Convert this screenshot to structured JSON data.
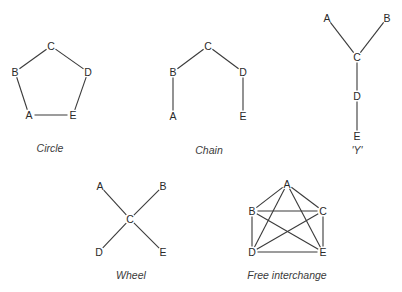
{
  "colors": {
    "edge": "#3a3a3a",
    "text": "#2a2a2a",
    "background": "#ffffff"
  },
  "networks": [
    {
      "id": "circle",
      "caption": "Circle",
      "caption_pos": [
        50,
        152
      ],
      "nodes": [
        {
          "label": "A",
          "x": 29,
          "y": 115
        },
        {
          "label": "B",
          "x": 15,
          "y": 72
        },
        {
          "label": "C",
          "x": 51,
          "y": 46
        },
        {
          "label": "D",
          "x": 88,
          "y": 72
        },
        {
          "label": "E",
          "x": 73,
          "y": 115
        }
      ],
      "edges": [
        [
          "B",
          "C"
        ],
        [
          "C",
          "D"
        ],
        [
          "D",
          "E"
        ],
        [
          "E",
          "A"
        ],
        [
          "A",
          "B"
        ]
      ]
    },
    {
      "id": "chain",
      "caption": "Chain",
      "caption_pos": [
        209,
        154
      ],
      "nodes": [
        {
          "label": "A",
          "x": 173,
          "y": 116
        },
        {
          "label": "B",
          "x": 173,
          "y": 72
        },
        {
          "label": "C",
          "x": 208,
          "y": 46
        },
        {
          "label": "D",
          "x": 243,
          "y": 72
        },
        {
          "label": "E",
          "x": 243,
          "y": 116
        }
      ],
      "edges": [
        [
          "A",
          "B"
        ],
        [
          "B",
          "C"
        ],
        [
          "C",
          "D"
        ],
        [
          "D",
          "E"
        ]
      ]
    },
    {
      "id": "y",
      "caption": "'Y'",
      "caption_pos": [
        357,
        154
      ],
      "nodes": [
        {
          "label": "A",
          "x": 327,
          "y": 18
        },
        {
          "label": "B",
          "x": 387,
          "y": 18
        },
        {
          "label": "C",
          "x": 357,
          "y": 57
        },
        {
          "label": "D",
          "x": 357,
          "y": 96
        },
        {
          "label": "E",
          "x": 357,
          "y": 136
        }
      ],
      "edges": [
        [
          "A",
          "C"
        ],
        [
          "B",
          "C"
        ],
        [
          "C",
          "D"
        ],
        [
          "D",
          "E"
        ]
      ]
    },
    {
      "id": "wheel",
      "caption": "Wheel",
      "caption_pos": [
        131,
        279
      ],
      "nodes": [
        {
          "label": "A",
          "x": 100,
          "y": 186
        },
        {
          "label": "B",
          "x": 163,
          "y": 186
        },
        {
          "label": "C",
          "x": 130,
          "y": 219
        },
        {
          "label": "D",
          "x": 99,
          "y": 252
        },
        {
          "label": "E",
          "x": 163,
          "y": 252
        }
      ],
      "edges": [
        [
          "A",
          "C"
        ],
        [
          "B",
          "C"
        ],
        [
          "D",
          "C"
        ],
        [
          "E",
          "C"
        ]
      ]
    },
    {
      "id": "free-interchange",
      "caption": "Free interchange",
      "caption_pos": [
        287,
        279
      ],
      "nodes": [
        {
          "label": "A",
          "x": 287,
          "y": 184
        },
        {
          "label": "B",
          "x": 252,
          "y": 211
        },
        {
          "label": "C",
          "x": 323,
          "y": 211
        },
        {
          "label": "D",
          "x": 252,
          "y": 252
        },
        {
          "label": "E",
          "x": 323,
          "y": 252
        }
      ],
      "edges": [
        [
          "A",
          "B"
        ],
        [
          "A",
          "C"
        ],
        [
          "A",
          "D"
        ],
        [
          "A",
          "E"
        ],
        [
          "B",
          "C"
        ],
        [
          "B",
          "D"
        ],
        [
          "B",
          "E"
        ],
        [
          "C",
          "D"
        ],
        [
          "C",
          "E"
        ],
        [
          "D",
          "E"
        ]
      ]
    }
  ]
}
